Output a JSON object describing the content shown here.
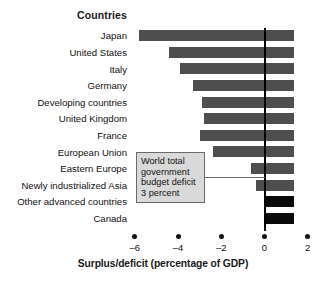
{
  "header": {
    "countries_label": "Countries"
  },
  "callout": {
    "line1": "World total",
    "line2": "government",
    "line3": "budget deficit",
    "line4": "3 percent"
  },
  "axis": {
    "title": "Surplus/deficit (percentage of GDP)",
    "tick_labels": [
      "–6",
      "–4",
      "–2",
      "0",
      "2"
    ]
  },
  "colors": {
    "negative_bar": "#4e4e4e",
    "positive_bar": "#0a0a0a",
    "zero_line": "#000000",
    "callout_fill": "#d9d9d9",
    "callout_border": "#6a6a6a",
    "background": "#ffffff"
  },
  "chart_data": {
    "type": "bar",
    "orientation": "horizontal",
    "title": "",
    "subtitle": "",
    "xlabel": "Surplus/deficit (percentage of GDP)",
    "ylabel": "Countries",
    "xlim": [
      -6.6,
      2.3
    ],
    "xticks": [
      -6,
      -4,
      -2,
      0,
      2
    ],
    "grid": false,
    "legend": null,
    "zero_reference_line": 0,
    "categories": [
      "Japan",
      "United States",
      "Italy",
      "Germany",
      "Developing countries",
      "United Kingdom",
      "France",
      "European Union",
      "Eastern Europe",
      "Newly industrialized Asia",
      "Other advanced countries",
      "Canada"
    ],
    "values": [
      -5.8,
      -4.4,
      -3.9,
      -3.3,
      -2.9,
      -2.8,
      -3.0,
      -2.4,
      -0.6,
      -0.4,
      1.35,
      1.35
    ],
    "annotations": [
      {
        "text": "World total government budget deficit 3 percent",
        "points_to_x": -3.0
      }
    ]
  }
}
